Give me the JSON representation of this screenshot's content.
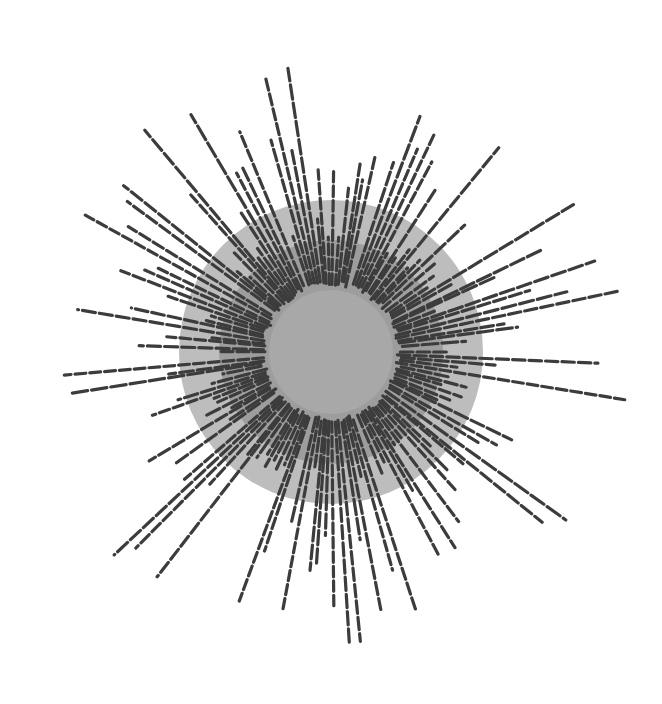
{
  "figure": {
    "center": [
      331,
      352
    ],
    "colors": {
      "background": "#ffffff",
      "outer_disc": "#bdbdbd",
      "middle_disc": "#9d9d9d",
      "inner_disc": "#a8a8a8",
      "rays": "#3c3c3c"
    },
    "discs": [
      {
        "name": "outer",
        "r": 152
      },
      {
        "name": "middle",
        "r": 112
      },
      {
        "name": "inner",
        "r": 62
      }
    ]
  }
}
